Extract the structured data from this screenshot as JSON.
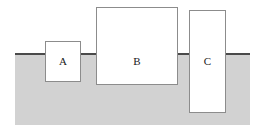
{
  "figure": {
    "name": "blocks-floating-in-fluid",
    "width": 265,
    "height": 134,
    "background_color": "#ffffff"
  },
  "fluid": {
    "label": "fluid-region",
    "fill_color": "#d2d2d2",
    "surface_color": "#4a4a4a",
    "x": 15,
    "y": 53,
    "width": 235,
    "height": 72,
    "surface_thickness": 2
  },
  "blocks": [
    {
      "label": "A",
      "x": 45,
      "y": 41,
      "width": 36,
      "height": 41,
      "fill_color": "#ffffff",
      "border_color": "#8c8c8c",
      "label_y": 56
    },
    {
      "label": "B",
      "x": 96,
      "y": 7,
      "width": 82,
      "height": 78,
      "fill_color": "#ffffff",
      "border_color": "#8c8c8c",
      "label_y": 56
    },
    {
      "label": "C",
      "x": 189,
      "y": 10,
      "width": 37,
      "height": 103,
      "fill_color": "#ffffff",
      "border_color": "#8c8c8c",
      "label_y": 56
    }
  ]
}
